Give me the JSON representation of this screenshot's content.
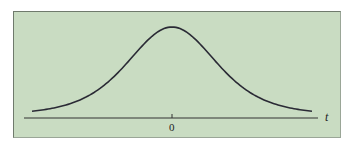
{
  "chart_data": {
    "type": "line",
    "title": "",
    "xlabel": "t",
    "ylabel": "",
    "x_ticks": [
      "0"
    ],
    "series": [
      {
        "name": "t density",
        "x": [
          -3,
          -2.5,
          -2,
          -1.5,
          -1,
          -0.5,
          0,
          0.5,
          1,
          1.5,
          2,
          2.5,
          3
        ],
        "values": [
          0.02,
          0.04,
          0.07,
          0.13,
          0.24,
          0.35,
          0.4,
          0.35,
          0.24,
          0.13,
          0.07,
          0.04,
          0.02
        ]
      }
    ],
    "grid": false,
    "legend": "none",
    "colors": {
      "background": "#c9dcc2",
      "curve": "#2a2a35",
      "axis": "#333333"
    }
  },
  "labels": {
    "axis_variable": "t",
    "center_tick": "0"
  }
}
